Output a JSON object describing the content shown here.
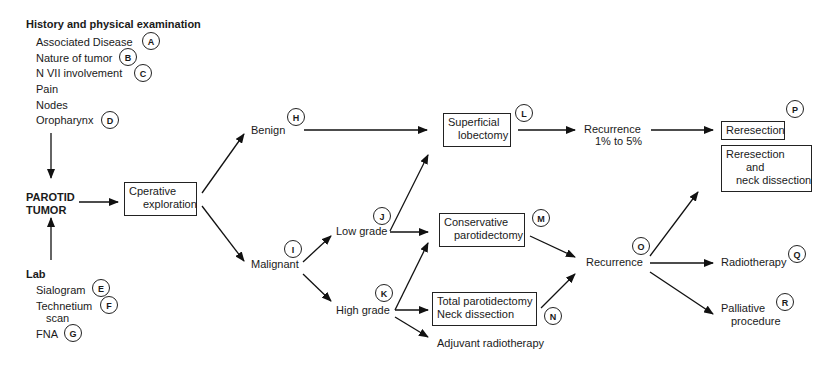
{
  "history": {
    "title": "History and physical examination",
    "items": [
      {
        "label": "Associated Disease",
        "marker": "A"
      },
      {
        "label": "Nature of tumor",
        "marker": "B"
      },
      {
        "label": "N VII involvement",
        "marker": "C"
      },
      {
        "label": "Pain",
        "marker": ""
      },
      {
        "label": "Nodes",
        "marker": ""
      },
      {
        "label": "Oropharynx",
        "marker": "D"
      }
    ]
  },
  "center": {
    "line1": "PAROTID",
    "line2": "TUMOR"
  },
  "lab": {
    "title": "Lab",
    "items": [
      {
        "label": "Sialogram",
        "marker": "E"
      },
      {
        "label": "Technetium",
        "label2": "scan",
        "marker": "F"
      },
      {
        "label": "FNA",
        "marker": "G"
      }
    ]
  },
  "nodes": {
    "operative": {
      "line1": "Cperative",
      "line2": "exploration"
    },
    "benign": {
      "label": "Benign",
      "marker": "H"
    },
    "malignant": {
      "label": "Malignant",
      "marker": "I"
    },
    "low_grade": {
      "label": "Low grade",
      "marker": "J"
    },
    "high_grade": {
      "label": "High grade",
      "marker": "K"
    },
    "superficial": {
      "line1": "Superficial",
      "line2": "lobectomy",
      "marker": "L"
    },
    "conservative": {
      "line1": "Conservative",
      "line2": "parotidectomy",
      "marker": "M"
    },
    "total": {
      "line1": "Total parotidectomy",
      "line2": "Neck dissection",
      "marker": "N"
    },
    "adjuvant": {
      "label": "Adjuvant radiotherapy"
    },
    "recurrence_low": {
      "line1": "Recurrence",
      "line2": "1% to 5%"
    },
    "recurrence": {
      "label": "Recurrence",
      "marker": "O"
    },
    "reresection": {
      "label": "Reresection",
      "marker": "P"
    },
    "reresection_neck": {
      "line1": "Reresection",
      "line2": "and",
      "line3": "neck dissection"
    },
    "radiotherapy": {
      "label": "Radiotherapy",
      "marker": "Q"
    },
    "palliative": {
      "line1": "Palliative",
      "line2": "procedure",
      "marker": "R"
    }
  }
}
